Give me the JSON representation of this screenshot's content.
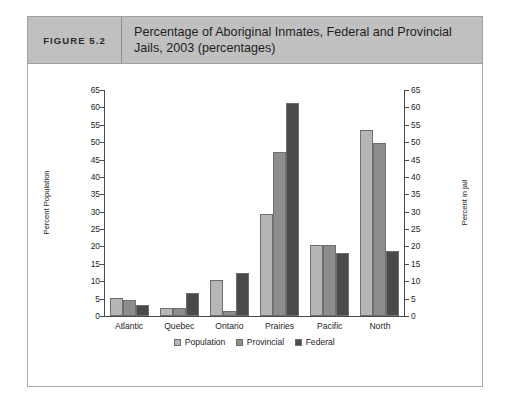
{
  "figure": {
    "label": "FIGURE 5.2",
    "title": "Percentage of Aboriginal Inmates, Federal and Provincial Jails, 2003 (percentages)"
  },
  "colors": {
    "population": "#b6b6b6",
    "provincial": "#8d8d8d",
    "federal": "#4a4a4a",
    "header_band": "#c0c0c0",
    "axis": "#4a4a4a",
    "frame": "#a8a8a8"
  },
  "chart_data": {
    "type": "bar",
    "title": "Percentage of Aboriginal Inmates, Federal and Provincial Jails, 2003 (percentages)",
    "xlabel": "",
    "ylabel": "Percent Population",
    "y2label": "Percent in jail",
    "ylim": [
      0,
      65
    ],
    "y2lim": [
      0,
      65
    ],
    "yticks": [
      0,
      5,
      10,
      15,
      20,
      25,
      30,
      35,
      40,
      45,
      50,
      55,
      60,
      65
    ],
    "y2ticks": [
      0,
      5,
      10,
      15,
      20,
      25,
      30,
      35,
      40,
      45,
      50,
      55,
      60,
      65
    ],
    "grid": false,
    "legend_position": "bottom",
    "categories": [
      "Atlantic",
      "Quebec",
      "Ontario",
      "Prairies",
      "Pacific",
      "North"
    ],
    "series": [
      {
        "name": "Population",
        "color": "#b6b6b6",
        "values": [
          5.3,
          2.2,
          10.3,
          29.3,
          20.5,
          53.5
        ]
      },
      {
        "name": "Provincial",
        "color": "#8d8d8d",
        "values": [
          4.6,
          2.2,
          1.3,
          47.2,
          20.5,
          49.7
        ]
      },
      {
        "name": "Federal",
        "color": "#4a4a4a",
        "values": [
          3.2,
          6.5,
          12.5,
          61.2,
          18.2,
          18.7
        ]
      }
    ]
  }
}
